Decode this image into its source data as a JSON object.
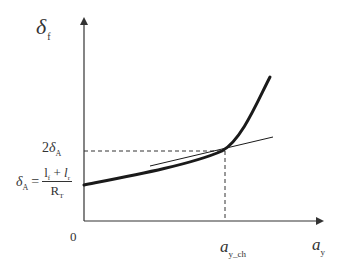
{
  "diagram": {
    "type": "function-plot",
    "axes": {
      "y": {
        "symbol": "δ",
        "subscript": "f"
      },
      "x": {
        "symbol": "a",
        "subscript": "y"
      },
      "origin_label": "0"
    },
    "annotations": {
      "two_delta": {
        "coefficient": "2",
        "symbol": "δ",
        "subscript": "A"
      },
      "formula": {
        "lhs_symbol": "δ",
        "lhs_subscript": "A",
        "equals": "=",
        "numerator": {
          "l1": "l",
          "l1_sub": "f",
          "plus": " + ",
          "l2": "l",
          "l2_sub": "r"
        },
        "denominator": {
          "symbol": "R",
          "subscript": "T"
        }
      },
      "characteristic_accel": {
        "symbol": "a",
        "subscript": "y_ch"
      }
    },
    "curves": [
      {
        "name": "nonlinear-response",
        "style": "thick",
        "color": "#1a1a1a"
      },
      {
        "name": "linear-tangent",
        "style": "thin",
        "color": "#1a1a1a"
      }
    ],
    "guides": [
      {
        "name": "horizontal-dashed-2deltaA",
        "style": "dashed"
      },
      {
        "name": "vertical-dashed-ay-ch",
        "style": "dashed"
      }
    ],
    "colors": {
      "axis": "#333333",
      "curve": "#1a1a1a",
      "text": "#333333",
      "background": "#ffffff"
    }
  }
}
